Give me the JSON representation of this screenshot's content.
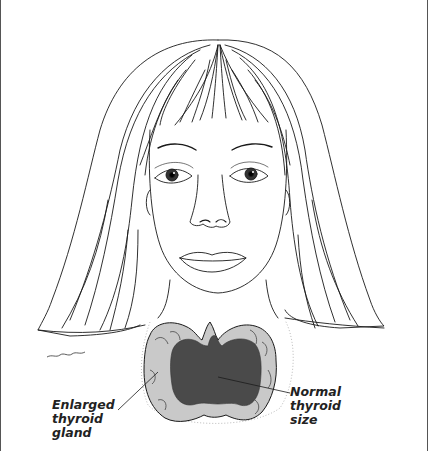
{
  "figure": {
    "colors": {
      "line": "#1a1a1a",
      "enlarged_fill": "#c9c9c9",
      "normal_fill": "#4a4a4a",
      "stipple": "#bbbbbb",
      "background": "#ffffff"
    }
  },
  "labels": {
    "enlarged": {
      "line1": "Enlarged",
      "line2": "thyroid",
      "line3": "gland"
    },
    "normal": {
      "line1": "Normal",
      "line2": "thyroid",
      "line3": "size"
    }
  }
}
